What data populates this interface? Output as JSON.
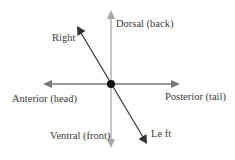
{
  "diagram": {
    "colors": {
      "background": "#ffffff",
      "vertical_axis": "#a8a8a8",
      "horizontal_axis": "#777777",
      "diagonal_axis": "#333333",
      "center_dot": "#111111",
      "label_text": "#3a3a3a"
    },
    "center": {
      "x": 111,
      "y": 84
    },
    "axes": [
      {
        "id": "dorsal-ventral",
        "from": "Dorsal (back)",
        "to": "Ventral (front)",
        "orientation": "vertical"
      },
      {
        "id": "anterior-posterior",
        "from": "Anterior (head)",
        "to": "Posterior (tail)",
        "orientation": "horizontal"
      },
      {
        "id": "right-left",
        "from": "Right",
        "to": "Left",
        "orientation": "diagonal"
      }
    ],
    "labels": {
      "dorsal": "Dorsal (back)",
      "ventral": "Ventral (front)",
      "anterior": "Anterior (head)",
      "posterior": "Posterior (tail)",
      "right": "Right",
      "left": "Le ft"
    }
  }
}
